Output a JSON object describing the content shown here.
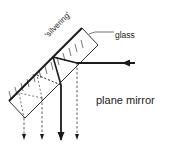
{
  "diagram": {
    "title": "plane mirror",
    "labels": {
      "silvering": "'silvering'",
      "glass": "glass",
      "caption": "plane mirror"
    },
    "colors": {
      "ink": "#1a1a1a",
      "background": "#ffffff"
    }
  }
}
